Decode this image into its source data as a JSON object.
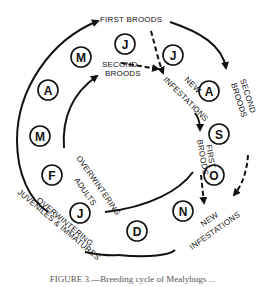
{
  "diagram": {
    "months": [
      {
        "id": "jan",
        "letter": "J"
      },
      {
        "id": "feb",
        "letter": "F"
      },
      {
        "id": "mar",
        "letter": "M"
      },
      {
        "id": "apr",
        "letter": "A"
      },
      {
        "id": "may",
        "letter": "M"
      },
      {
        "id": "jun",
        "letter": "J"
      },
      {
        "id": "jul",
        "letter": "J"
      },
      {
        "id": "aug",
        "letter": "A"
      },
      {
        "id": "sep",
        "letter": "S"
      },
      {
        "id": "oct",
        "letter": "O"
      },
      {
        "id": "nov",
        "letter": "N"
      },
      {
        "id": "dec",
        "letter": "D"
      }
    ],
    "labels": {
      "first_broods_top": "FIRST BROODS",
      "second_broods_inner_1": "SECOND",
      "second_broods_inner_2": "BROODS",
      "second_broods_outer_1": "SECOND",
      "second_broods_outer_2": "BROODS",
      "new_infestations_1_a": "NEW",
      "new_infestations_1_b": "INFESTATIONS",
      "first_broods_inner_1": "FIRST",
      "first_broods_inner_2": "BROODS",
      "new_infestations_2_a": "NEW",
      "new_infestations_2_b": "INFESTATIONS",
      "overwintering_adults_1": "OVERWINTERING",
      "overwintering_adults_2": "ADULTS",
      "overwintering_juv_1": "OVERWINTERING",
      "overwintering_juv_2": "JUVENILES & IMMATURES"
    }
  },
  "caption": "FIGURE 3.—Breeding cycle of Mealybugs ..."
}
